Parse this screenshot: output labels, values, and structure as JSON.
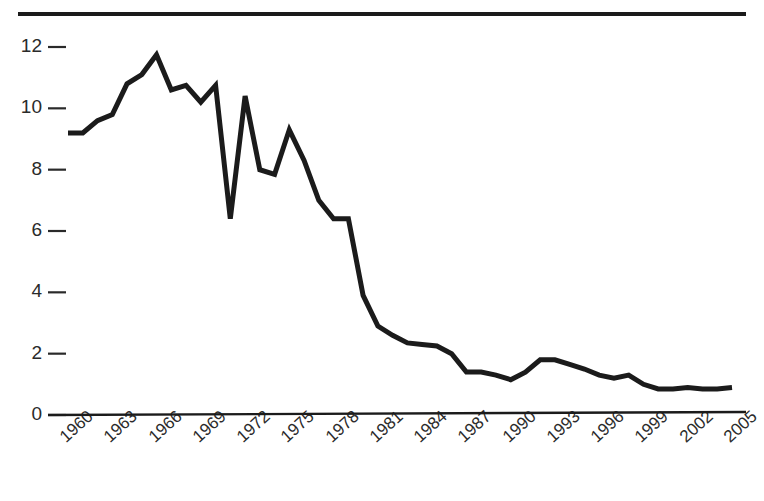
{
  "figure": {
    "top_rule": true,
    "cut_off_header_text": ""
  },
  "chart_data": {
    "type": "line",
    "title": "",
    "subtitle": "",
    "xlabel": "",
    "ylabel": "",
    "xlim": [
      1959,
      2006
    ],
    "ylim": [
      0,
      12.6
    ],
    "grid": false,
    "legend": null,
    "line_color": "#1b1b1b",
    "line_width": 5,
    "y_ticks": [
      0,
      2,
      4,
      6,
      8,
      10,
      12
    ],
    "y_tick_labels": [
      "0",
      "2",
      "4",
      "6",
      "8",
      "10",
      "12"
    ],
    "x_ticks": [
      1960,
      1963,
      1966,
      1969,
      1972,
      1975,
      1978,
      1981,
      1984,
      1987,
      1990,
      1993,
      1996,
      1999,
      2002,
      2005
    ],
    "x_tick_labels": [
      "1960",
      "1963",
      "1966",
      "1969",
      "1972",
      "1975",
      "1978",
      "1981",
      "1984",
      "1987",
      "1990",
      "1993",
      "1996",
      "1999",
      "2002",
      "2005"
    ],
    "x_tick_rotation": -42,
    "series": [
      {
        "name": "value",
        "x": [
          1960,
          1961,
          1962,
          1963,
          1964,
          1965,
          1966,
          1967,
          1968,
          1969,
          1970,
          1971,
          1972,
          1973,
          1974,
          1975,
          1976,
          1977,
          1978,
          1979,
          1980,
          1981,
          1982,
          1983,
          1984,
          1985,
          1986,
          1987,
          1988,
          1989,
          1990,
          1991,
          1992,
          1993,
          1994,
          1995,
          1996,
          1997,
          1998,
          1999,
          2000,
          2001,
          2002,
          2003,
          2004,
          2005
        ],
        "values": [
          9.2,
          9.2,
          9.6,
          9.8,
          10.8,
          11.1,
          11.75,
          10.6,
          10.75,
          10.2,
          10.75,
          6.4,
          10.4,
          8.0,
          7.85,
          9.3,
          8.3,
          7.0,
          6.4,
          6.4,
          3.9,
          2.9,
          2.6,
          2.35,
          2.3,
          2.25,
          2.0,
          1.4,
          1.4,
          1.3,
          1.15,
          1.4,
          1.8,
          1.8,
          1.65,
          1.5,
          1.3,
          1.2,
          1.3,
          1.0,
          0.85,
          0.85,
          0.9,
          0.85,
          0.85,
          0.9
        ]
      }
    ]
  }
}
